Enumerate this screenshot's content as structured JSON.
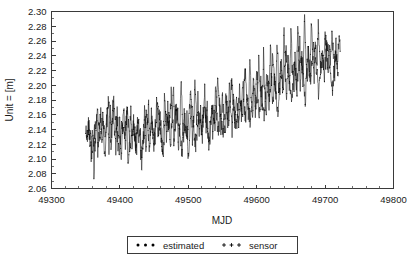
{
  "chart_data": {
    "type": "line",
    "title": "",
    "xlabel": "MJD",
    "ylabel": "Unit = [m]",
    "xlim": [
      49300,
      49800
    ],
    "ylim": [
      2.06,
      2.3
    ],
    "xticks": [
      49300,
      49400,
      49500,
      49600,
      49700,
      49800
    ],
    "yticks": [
      2.06,
      2.08,
      2.1,
      2.12,
      2.14,
      2.16,
      2.18,
      2.2,
      2.22,
      2.24,
      2.26,
      2.28,
      2.3
    ],
    "xtick_labels": [
      "49300",
      "49400",
      "49500",
      "49600",
      "49700",
      "49800"
    ],
    "ytick_labels": [
      "2.06",
      "2.08",
      "2.10",
      "2.12",
      "2.14",
      "2.16",
      "2.18",
      "2.20",
      "2.22",
      "2.24",
      "2.26",
      "2.28",
      "2.30"
    ],
    "x_minor_interval": 20,
    "y_minor_interval": 0.01,
    "grid": false,
    "legend_position": "below-outside",
    "legend": [
      {
        "name": "estimated",
        "marker": "filled-circle",
        "color": "#000000"
      },
      {
        "name": "sensor",
        "marker": "plus",
        "color": "#000000"
      }
    ],
    "x_data_range": [
      49350,
      49722
    ],
    "series": [
      {
        "name": "estimated",
        "marker": "filled-circle",
        "color": "#000000",
        "x": [
          49350,
          49352,
          49354,
          49356,
          49358,
          49360,
          49362,
          49364,
          49366,
          49368,
          49370,
          49372,
          49374,
          49376,
          49378,
          49380,
          49382,
          49384,
          49386,
          49388,
          49390,
          49392,
          49394,
          49396,
          49398,
          49400,
          49402,
          49404,
          49406,
          49408,
          49410,
          49412,
          49414,
          49416,
          49418,
          49420,
          49422,
          49424,
          49426,
          49428,
          49430,
          49432,
          49434,
          49436,
          49438,
          49440,
          49442,
          49444,
          49446,
          49448,
          49450,
          49452,
          49454,
          49456,
          49458,
          49460,
          49462,
          49464,
          49466,
          49468,
          49470,
          49472,
          49474,
          49476,
          49478,
          49480,
          49482,
          49484,
          49486,
          49488,
          49490,
          49492,
          49494,
          49496,
          49498,
          49500,
          49502,
          49504,
          49506,
          49508,
          49510,
          49512,
          49514,
          49516,
          49518,
          49520,
          49522,
          49524,
          49526,
          49528,
          49530,
          49532,
          49534,
          49536,
          49538,
          49540,
          49542,
          49544,
          49546,
          49548,
          49550,
          49552,
          49554,
          49556,
          49558,
          49560,
          49562,
          49564,
          49566,
          49568,
          49570,
          49572,
          49574,
          49576,
          49578,
          49580,
          49582,
          49584,
          49586,
          49588,
          49590,
          49592,
          49594,
          49596,
          49598,
          49600,
          49602,
          49604,
          49606,
          49608,
          49610,
          49612,
          49614,
          49616,
          49618,
          49620,
          49622,
          49624,
          49626,
          49628,
          49630,
          49632,
          49634,
          49636,
          49638,
          49640,
          49642,
          49644,
          49646,
          49648,
          49650,
          49652,
          49654,
          49656,
          49658,
          49660,
          49662,
          49664,
          49666,
          49668,
          49670,
          49672,
          49674,
          49676,
          49678,
          49680,
          49682,
          49684,
          49686,
          49688,
          49690,
          49692,
          49694,
          49696,
          49698,
          49700,
          49702,
          49704,
          49706,
          49708,
          49710,
          49712,
          49714,
          49716,
          49718,
          49720,
          49722
        ],
        "y": [
          2.14,
          2.118,
          2.155,
          2.126,
          2.11,
          2.143,
          2.085,
          2.13,
          2.152,
          2.108,
          2.135,
          2.162,
          2.12,
          2.148,
          2.1,
          2.138,
          2.172,
          2.115,
          2.16,
          2.128,
          2.19,
          2.145,
          2.112,
          2.168,
          2.132,
          2.15,
          2.106,
          2.141,
          2.176,
          2.122,
          2.158,
          2.095,
          2.136,
          2.164,
          2.118,
          2.148,
          2.131,
          2.108,
          2.152,
          2.125,
          2.142,
          2.088,
          2.133,
          2.16,
          2.12,
          2.145,
          2.17,
          2.128,
          2.155,
          2.136,
          2.112,
          2.148,
          2.182,
          2.13,
          2.164,
          2.14,
          2.108,
          2.156,
          2.192,
          2.134,
          2.166,
          2.148,
          2.122,
          2.158,
          2.205,
          2.142,
          2.174,
          2.15,
          2.118,
          2.162,
          2.196,
          2.145,
          2.168,
          2.132,
          2.155,
          2.098,
          2.14,
          2.175,
          2.124,
          2.16,
          2.212,
          2.148,
          2.18,
          2.138,
          2.166,
          2.12,
          2.152,
          2.188,
          2.142,
          2.17,
          2.108,
          2.145,
          2.178,
          2.13,
          2.162,
          2.196,
          2.15,
          2.125,
          2.168,
          2.14,
          2.185,
          2.155,
          2.13,
          2.172,
          2.145,
          2.2,
          2.16,
          2.135,
          2.178,
          2.152,
          2.19,
          2.165,
          2.142,
          2.182,
          2.158,
          2.21,
          2.17,
          2.148,
          2.188,
          2.162,
          2.225,
          2.178,
          2.155,
          2.195,
          2.168,
          2.232,
          2.182,
          2.158,
          2.2,
          2.172,
          2.24,
          2.19,
          2.165,
          2.208,
          2.18,
          2.252,
          2.198,
          2.172,
          2.215,
          2.186,
          2.26,
          2.205,
          2.178,
          2.222,
          2.192,
          2.27,
          2.212,
          2.185,
          2.23,
          2.198,
          2.278,
          2.22,
          2.192,
          2.238,
          2.205,
          2.285,
          2.228,
          2.198,
          2.245,
          2.212,
          2.29,
          2.235,
          2.205,
          2.25,
          2.218,
          2.282,
          2.24,
          2.21,
          2.255,
          2.222,
          2.275,
          2.245,
          2.215,
          2.258,
          2.226,
          2.268,
          2.248,
          2.218,
          2.26,
          2.228,
          2.262,
          2.25,
          2.22,
          2.256,
          2.23,
          2.255,
          2.246
        ]
      },
      {
        "name": "sensor",
        "marker": "plus",
        "color": "#000000",
        "x": [
          49351,
          49355,
          49359,
          49363,
          49367,
          49371,
          49375,
          49379,
          49383,
          49387,
          49391,
          49395,
          49399,
          49403,
          49407,
          49411,
          49415,
          49419,
          49423,
          49427,
          49431,
          49435,
          49439,
          49443,
          49447,
          49451,
          49455,
          49459,
          49463,
          49467,
          49471,
          49475,
          49479,
          49483,
          49487,
          49491,
          49495,
          49499,
          49503,
          49507,
          49511,
          49515,
          49519,
          49523,
          49527,
          49531,
          49535,
          49539,
          49543,
          49547,
          49551,
          49555,
          49559,
          49563,
          49567,
          49571,
          49575,
          49579,
          49583,
          49587,
          49591,
          49595,
          49599,
          49603,
          49607,
          49611,
          49615,
          49619,
          49623,
          49627,
          49631,
          49635,
          49639,
          49643,
          49647,
          49651,
          49655,
          49659,
          49663,
          49667,
          49671,
          49675,
          49679,
          49683,
          49687,
          49691,
          49695,
          49699,
          49703,
          49707,
          49711,
          49715,
          49719
        ],
        "y": [
          2.128,
          2.148,
          2.102,
          2.138,
          2.165,
          2.115,
          2.158,
          2.128,
          2.182,
          2.12,
          2.175,
          2.14,
          2.108,
          2.152,
          2.13,
          2.168,
          2.112,
          2.145,
          2.122,
          2.158,
          2.098,
          2.135,
          2.162,
          2.118,
          2.148,
          2.125,
          2.172,
          2.138,
          2.102,
          2.16,
          2.142,
          2.185,
          2.128,
          2.165,
          2.145,
          2.108,
          2.155,
          2.132,
          2.19,
          2.148,
          2.118,
          2.162,
          2.138,
          2.175,
          2.152,
          2.122,
          2.168,
          2.145,
          2.198,
          2.158,
          2.135,
          2.18,
          2.152,
          2.205,
          2.168,
          2.142,
          2.192,
          2.16,
          2.218,
          2.175,
          2.148,
          2.2,
          2.172,
          2.228,
          2.185,
          2.158,
          2.212,
          2.18,
          2.238,
          2.195,
          2.168,
          2.222,
          2.188,
          2.248,
          2.202,
          2.175,
          2.232,
          2.195,
          2.258,
          2.212,
          2.182,
          2.242,
          2.205,
          2.265,
          2.222,
          2.188,
          2.248,
          2.215,
          2.255,
          2.23,
          2.195,
          2.24,
          2.212
        ]
      }
    ]
  },
  "axes": {
    "y_title": "Unit = [m]",
    "x_title": "MJD"
  },
  "legend": {
    "items": [
      {
        "label": "estimated",
        "marker": "filled-circle"
      },
      {
        "label": "sensor",
        "marker": "plus"
      }
    ]
  }
}
